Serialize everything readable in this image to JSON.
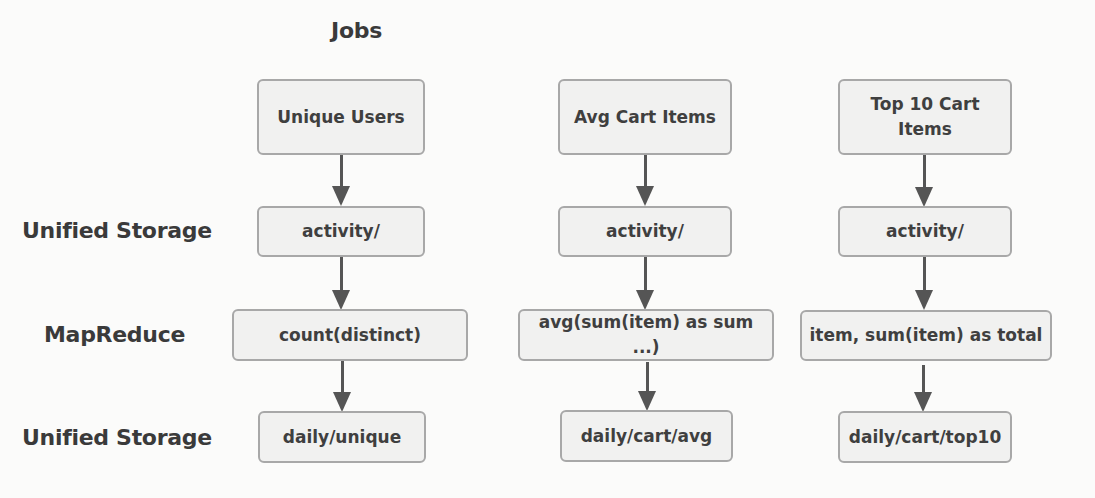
{
  "header": {
    "title": "Jobs"
  },
  "layers": [
    {
      "label": "Unified Storage"
    },
    {
      "label": "MapReduce"
    },
    {
      "label": "Unified Storage"
    }
  ],
  "columns": [
    {
      "job": "Unique Users",
      "input": "activity/",
      "mapreduce": "count(distinct)",
      "output": "daily/unique"
    },
    {
      "job": "Avg Cart Items",
      "input": "activity/",
      "mapreduce": "avg(sum(item) as sum ...)",
      "output": "daily/cart/avg"
    },
    {
      "job": "Top 10 Cart Items",
      "input": "activity/",
      "mapreduce": "item, sum(item) as total",
      "output": "daily/cart/top10"
    }
  ],
  "colors": {
    "box_fill": "#f1f1f0",
    "box_border": "#a8a8a8",
    "arrow": "#555555",
    "text": "#3f3f3f"
  }
}
